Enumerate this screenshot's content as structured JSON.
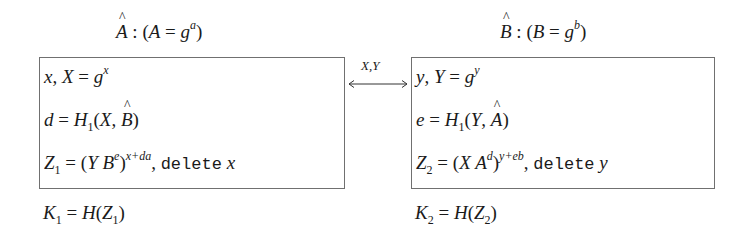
{
  "diagram": {
    "type": "key-exchange-protocol",
    "parties": [
      {
        "id": "A",
        "title": "Â : (A = g^a)",
        "title_parts": {
          "hat": "A",
          "base": "A",
          "g": "g",
          "exp": "a"
        },
        "steps": [
          "x, X = g^x",
          "d = H_1(X, B̂)",
          "Z_1 = (Y B^e)^(x+da), delete x"
        ],
        "step_parts": {
          "s1": {
            "var": "x",
            "pub": "X",
            "g": "g",
            "exp": "x"
          },
          "s2": {
            "lhs": "d",
            "fn": "H",
            "sub": "1",
            "a1": "X",
            "a2": "B"
          },
          "s3": {
            "lhs": "Z",
            "sub": "1",
            "term": "Y B",
            "sup_inner": "e",
            "exp": "x+da",
            "delete": "delete",
            "del_var": "x"
          }
        },
        "key": {
          "text": "K_1 = H(Z_1)",
          "lhs": "K",
          "sub": "1",
          "fn": "H",
          "arg": "Z",
          "arg_sub": "1"
        }
      },
      {
        "id": "B",
        "title": "B̂ : (B = g^b)",
        "title_parts": {
          "hat": "B",
          "base": "B",
          "g": "g",
          "exp": "b"
        },
        "steps": [
          "y, Y = g^y",
          "e = H_1(Y, Â)",
          "Z_2 = (X A^d)^(y+eb), delete y"
        ],
        "step_parts": {
          "s1": {
            "var": "y",
            "pub": "Y",
            "g": "g",
            "exp": "y"
          },
          "s2": {
            "lhs": "e",
            "fn": "H",
            "sub": "1",
            "a1": "Y",
            "a2": "A"
          },
          "s3": {
            "lhs": "Z",
            "sub": "2",
            "term": "X A",
            "sup_inner": "d",
            "exp": "y+eb",
            "delete": "delete",
            "del_var": "y"
          }
        },
        "key": {
          "text": "K_2 = H(Z_2)",
          "lhs": "K",
          "sub": "2",
          "fn": "H",
          "arg": "Z",
          "arg_sub": "2"
        }
      }
    ],
    "exchange": {
      "label": "X,Y",
      "direction": "bidirectional",
      "arrow_icon": "double-arrow"
    },
    "colors": {
      "border": "#707070",
      "text": "#1a1a1a",
      "background": "#ffffff"
    }
  }
}
